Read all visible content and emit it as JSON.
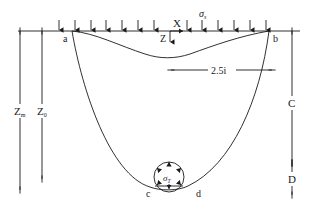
{
  "diagram": {
    "surface_load": {
      "symbol": "σ",
      "subscript": "s"
    },
    "support_pressure": {
      "symbol": "σ",
      "subscript": "T"
    },
    "axes": {
      "x": "X",
      "z": "Z"
    },
    "points": {
      "a": "a",
      "b": "b",
      "c": "c",
      "d": "d"
    },
    "dimensions": {
      "zm": {
        "symbol": "Z",
        "subscript": "m"
      },
      "z0": {
        "symbol": "Z",
        "subscript": "0"
      },
      "width": "2.5i",
      "cover": "C",
      "diameter": "D"
    },
    "colors": {
      "line": "#1a1a1a",
      "background": "#ffffff"
    }
  }
}
